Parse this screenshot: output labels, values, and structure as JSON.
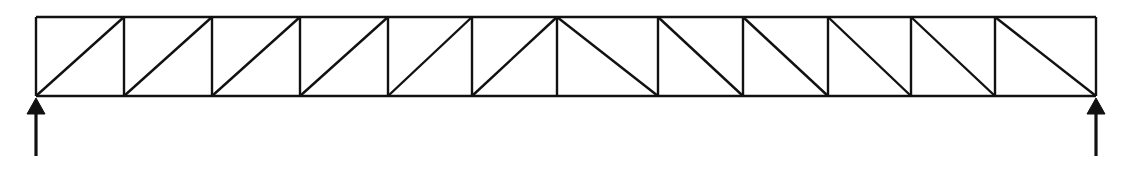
{
  "figure": {
    "kind": "structural-truss-diagram",
    "background_color": "#ffffff",
    "line_color": "#111111",
    "line_width": 2.4
  },
  "chart_data": {
    "type": "diagram",
    "subtitle": "",
    "xlabel": "",
    "ylabel": "",
    "grid": false,
    "legend": false,
    "xlim": [
      0,
      1126
    ],
    "ylim": [
      0,
      169
    ],
    "geometry": {
      "top_chord_y": 17,
      "bottom_chord_y": 96,
      "truss_depth": 79,
      "left_end_x": 36,
      "right_end_x": 1096,
      "span_length": 1060,
      "panel_count": 12,
      "node_x": [
        36,
        124,
        212,
        300,
        388,
        472,
        557,
        658,
        743,
        828,
        911,
        995,
        1096
      ],
      "symmetry_axis_x": 557
    },
    "members": {
      "top_chord": [
        {
          "x1": 36,
          "y1": 17,
          "x2": 1096,
          "y2": 17
        }
      ],
      "bottom_chord": [
        {
          "x1": 36,
          "y1": 96,
          "x2": 1096,
          "y2": 96
        }
      ],
      "verticals": [
        {
          "x": 36,
          "y1": 17,
          "y2": 96
        },
        {
          "x": 124,
          "y1": 17,
          "y2": 96
        },
        {
          "x": 212,
          "y1": 17,
          "y2": 96
        },
        {
          "x": 300,
          "y1": 17,
          "y2": 96
        },
        {
          "x": 388,
          "y1": 17,
          "y2": 96
        },
        {
          "x": 472,
          "y1": 17,
          "y2": 96
        },
        {
          "x": 557,
          "y1": 17,
          "y2": 96
        },
        {
          "x": 658,
          "y1": 17,
          "y2": 96
        },
        {
          "x": 743,
          "y1": 17,
          "y2": 96
        },
        {
          "x": 828,
          "y1": 17,
          "y2": 96
        },
        {
          "x": 911,
          "y1": 17,
          "y2": 96
        },
        {
          "x": 995,
          "y1": 17,
          "y2": 96
        },
        {
          "x": 1096,
          "y1": 17,
          "y2": 96
        }
      ],
      "diagonals": [
        {
          "x1": 36,
          "y1": 96,
          "x2": 124,
          "y2": 17,
          "slope": "up-right"
        },
        {
          "x1": 124,
          "y1": 96,
          "x2": 212,
          "y2": 17,
          "slope": "up-right"
        },
        {
          "x1": 212,
          "y1": 96,
          "x2": 300,
          "y2": 17,
          "slope": "up-right"
        },
        {
          "x1": 300,
          "y1": 96,
          "x2": 388,
          "y2": 17,
          "slope": "up-right"
        },
        {
          "x1": 388,
          "y1": 96,
          "x2": 472,
          "y2": 17,
          "slope": "up-right"
        },
        {
          "x1": 472,
          "y1": 96,
          "x2": 557,
          "y2": 17,
          "slope": "up-right"
        },
        {
          "x1": 557,
          "y1": 17,
          "x2": 658,
          "y2": 96,
          "slope": "down-right"
        },
        {
          "x1": 658,
          "y1": 17,
          "x2": 743,
          "y2": 96,
          "slope": "down-right"
        },
        {
          "x1": 743,
          "y1": 17,
          "x2": 828,
          "y2": 96,
          "slope": "down-right"
        },
        {
          "x1": 828,
          "y1": 17,
          "x2": 911,
          "y2": 96,
          "slope": "down-right"
        },
        {
          "x1": 911,
          "y1": 17,
          "x2": 995,
          "y2": 96,
          "slope": "down-right"
        },
        {
          "x1": 995,
          "y1": 17,
          "x2": 1096,
          "y2": 96,
          "slope": "down-right"
        }
      ]
    },
    "supports": [
      {
        "name": "left-support",
        "node_x": 36,
        "node_y": 96,
        "direction": "up",
        "head_tip_y": 98,
        "head_base_y": 114,
        "head_half_width": 9,
        "shaft_bottom_y": 156
      },
      {
        "name": "right-support",
        "node_x": 1096,
        "node_y": 96,
        "direction": "up",
        "head_tip_y": 98,
        "head_base_y": 114,
        "head_half_width": 9,
        "shaft_bottom_y": 156
      }
    ]
  }
}
